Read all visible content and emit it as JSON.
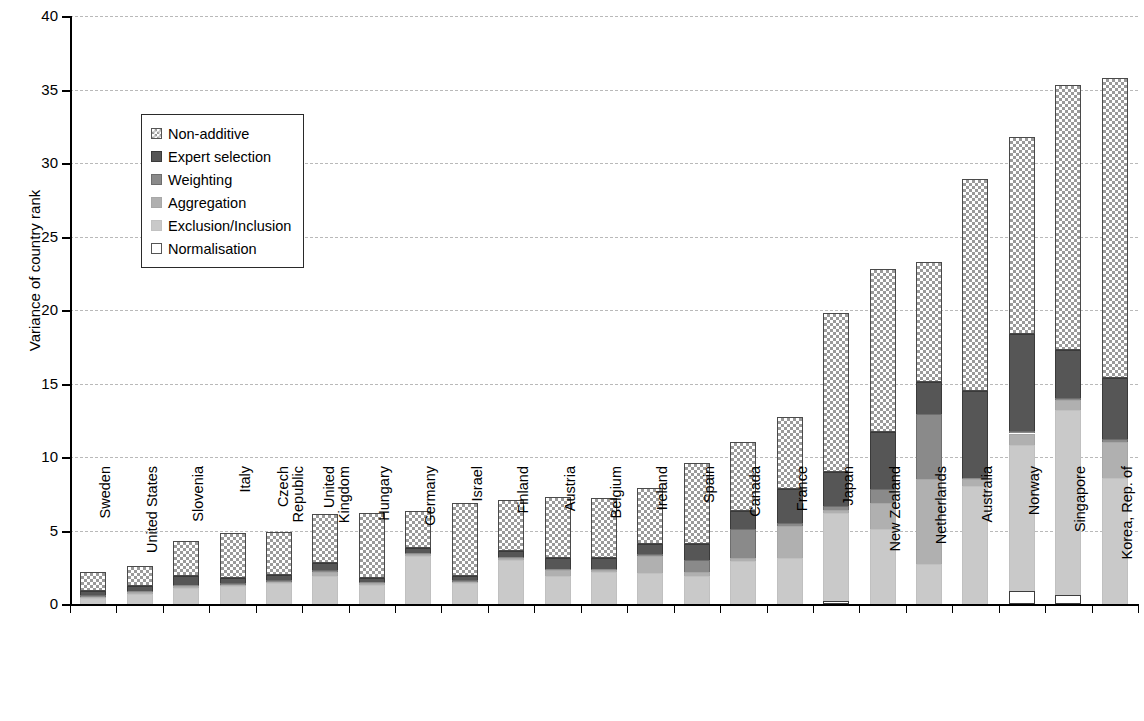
{
  "chart_data": {
    "type": "bar",
    "subtype": "stacked-bar",
    "title": "",
    "xlabel": "",
    "ylabel": "Variance of country rank",
    "ylim": [
      0,
      40
    ],
    "yticks": [
      0,
      5,
      10,
      15,
      20,
      25,
      30,
      35,
      40
    ],
    "grid": true,
    "legend_position": "upper-left-inside",
    "categories": [
      "Sweden",
      "United States",
      "Slovenia",
      "Italy",
      "Czech\nRepublic",
      "United\nKingdom",
      "Hungary",
      "Germany",
      "Israel",
      "Finland",
      "Austria",
      "Belgium",
      "Ireland",
      "Spain",
      "Canada",
      "France",
      "Japan",
      "New Zealand",
      "Netherlands",
      "Australia",
      "Norway",
      "Singapore",
      "Korea, Rep. of"
    ],
    "series": [
      {
        "name": "Normalisation",
        "color": "#ffffff",
        "values": [
          0,
          0,
          0,
          0,
          0,
          0,
          0,
          0,
          0,
          0,
          0,
          0,
          0,
          0,
          0,
          0,
          0.2,
          0,
          0,
          0,
          0.9,
          0.6,
          0
        ]
      },
      {
        "name": "Exclusion/Inclusion",
        "color": "#c9c9c9",
        "values": [
          0.4,
          0.7,
          1.1,
          1.2,
          1.4,
          1.9,
          1.3,
          3.3,
          1.4,
          3.0,
          1.9,
          2.2,
          2.1,
          1.9,
          2.9,
          3.1,
          6.0,
          5.1,
          2.7,
          8.0,
          9.9,
          12.6,
          8.6
        ]
      },
      {
        "name": "Aggregation",
        "color": "#b0b0b0",
        "values": [
          0.1,
          0.1,
          0.1,
          0.1,
          0.1,
          0.3,
          0.1,
          0.1,
          0.1,
          0.1,
          0.4,
          0.1,
          1.2,
          0.3,
          0.2,
          2.2,
          0.2,
          1.8,
          5.8,
          0.5,
          0.8,
          0.7,
          2.4
        ]
      },
      {
        "name": "Weighting",
        "color": "#8a8a8a",
        "values": [
          0.1,
          0.1,
          0.1,
          0.1,
          0.1,
          0.1,
          0.1,
          0.1,
          0.1,
          0.1,
          0.1,
          0.1,
          0.1,
          0.8,
          2.0,
          0.2,
          0.3,
          0.9,
          4.4,
          0.1,
          0.2,
          0.1,
          0.2
        ]
      },
      {
        "name": "Expert selection",
        "color": "#565656",
        "values": [
          0.3,
          0.3,
          0.6,
          0.4,
          0.4,
          0.5,
          0.3,
          0.3,
          0.3,
          0.4,
          0.7,
          0.7,
          0.7,
          1.1,
          1.2,
          2.3,
          2.3,
          3.9,
          2.2,
          5.9,
          6.6,
          3.3,
          4.2
        ]
      },
      {
        "name": "Non-additive",
        "color": "#9a9a9a",
        "values": [
          1.3,
          1.4,
          2.4,
          3.0,
          2.9,
          3.3,
          4.4,
          2.5,
          5.0,
          3.5,
          4.2,
          4.1,
          3.8,
          5.5,
          4.7,
          4.9,
          10.8,
          11.1,
          8.2,
          14.4,
          13.4,
          18.0,
          20.4
        ]
      }
    ],
    "totals": [
      2.2,
      2.6,
      4.3,
      4.8,
      4.9,
      6.1,
      6.2,
      6.3,
      6.9,
      7.1,
      7.3,
      7.2,
      7.9,
      9.6,
      11.0,
      12.8,
      19.6,
      22.8,
      23.3,
      28.9,
      31.8,
      35.3,
      35.8
    ]
  },
  "legend": {
    "items": [
      {
        "label": "Non-additive",
        "swatch": "non-additive-swatch"
      },
      {
        "label": "Expert selection",
        "swatch": "expert-selection-swatch"
      },
      {
        "label": "Weighting",
        "swatch": "weighting-swatch"
      },
      {
        "label": "Aggregation",
        "swatch": "aggregation-swatch"
      },
      {
        "label": "Exclusion/Inclusion",
        "swatch": "exclusion-inclusion-swatch"
      },
      {
        "label": "Normalisation",
        "swatch": "normalisation-swatch"
      }
    ]
  }
}
